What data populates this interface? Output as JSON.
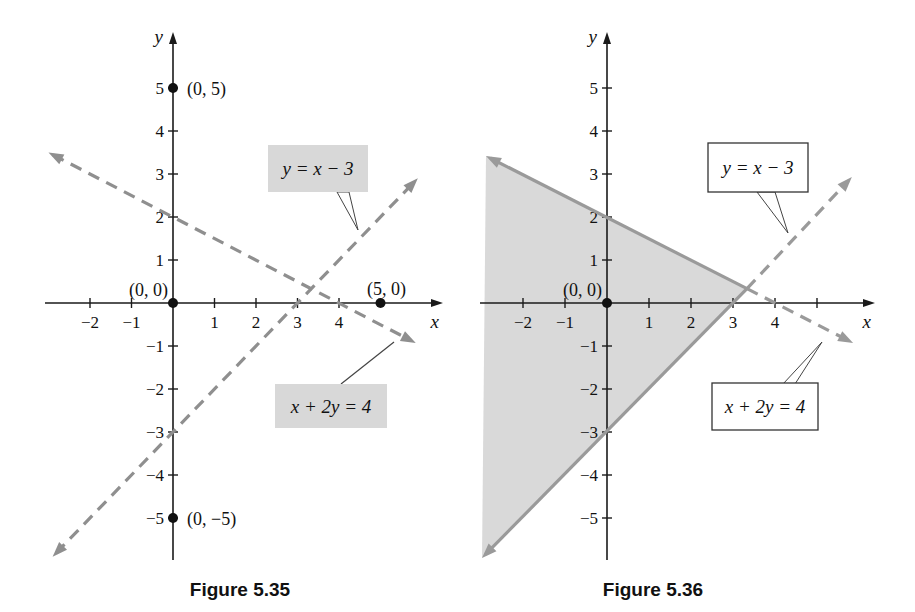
{
  "page": {
    "background": "#ffffff"
  },
  "chart_data": [
    {
      "type": "line",
      "figure_id": "5.35",
      "title": "Figure 5.35",
      "xlabel": "x",
      "ylabel": "y",
      "xlim": [
        -3.1,
        6.5
      ],
      "ylim": [
        -6.0,
        6.3
      ],
      "grid": false,
      "x_ticks": [
        -2,
        -1,
        1,
        2,
        3,
        4
      ],
      "x_ticks_unlabeled": [],
      "y_ticks": [
        5,
        4,
        3,
        2,
        1,
        -1,
        -2,
        -3,
        -4,
        -5
      ],
      "axis_color": "#1a1a1a",
      "series": [
        {
          "name": "y = x − 3",
          "equation": "y = x − 3",
          "color": "#8f8f8f",
          "style": "dashed",
          "x_intercept": 3,
          "y_intercept": -3,
          "segments": [
            {
              "from": [
                -2.9,
                -5.9
              ],
              "to": [
                5.9,
                2.9
              ],
              "style": "dashed",
              "arrows": [
                "from",
                "to"
              ]
            }
          ]
        },
        {
          "name": "x + 2y = 4",
          "equation": "x + 2y = 4",
          "color": "#8f8f8f",
          "style": "dashed",
          "x_intercept": 4,
          "y_intercept": 2,
          "segments": [
            {
              "from": [
                -3.0,
                3.5
              ],
              "to": [
                5.85,
                -0.93
              ],
              "style": "dashed",
              "arrows": [
                "from",
                "to"
              ]
            }
          ]
        }
      ],
      "marked_points": [
        {
          "label": "(0, 5)",
          "x": 0,
          "y": 5,
          "label_pos": "right"
        },
        {
          "label": "(0, 0)",
          "x": 0,
          "y": 0,
          "label_pos": "above-left"
        },
        {
          "label": "(5, 0)",
          "x": 5,
          "y": 0,
          "label_pos": "above"
        },
        {
          "label": "(0, −5)",
          "x": 0,
          "y": -5,
          "label_pos": "right"
        }
      ],
      "annotations": [
        {
          "text": "y = x − 3",
          "box_fill": "#d8d8d8",
          "box_stroke": "none"
        },
        {
          "text": "x + 2y = 4",
          "box_fill": "#d8d8d8",
          "box_stroke": "none"
        }
      ]
    },
    {
      "type": "line",
      "figure_id": "5.36",
      "title": "Figure 5.36",
      "xlabel": "x",
      "ylabel": "y",
      "xlim": [
        -3.05,
        6.4
      ],
      "ylim": [
        -6.0,
        6.3
      ],
      "grid": false,
      "x_ticks": [
        -2,
        -1,
        1,
        2,
        3,
        4
      ],
      "x_ticks_unlabeled": [
        5
      ],
      "y_ticks": [
        5,
        4,
        3,
        2,
        1,
        -1,
        -2,
        -3,
        -4,
        -5
      ],
      "axis_color": "#1a1a1a",
      "region": {
        "vertices": [
          [
            3.333,
            0.333
          ],
          [
            -2.881,
            3.419
          ],
          [
            -2.976,
            -5.93
          ]
        ],
        "fill": "#d9d9d9"
      },
      "series": [
        {
          "name": "y = x − 3",
          "equation": "y = x − 3",
          "color": "#9a9a9a",
          "x_intercept": 3,
          "y_intercept": -3,
          "segments": [
            {
              "from": [
                -2.976,
                -5.93
              ],
              "to": [
                3.333,
                0.333
              ],
              "style": "solid",
              "arrows": [
                "from"
              ]
            },
            {
              "from": [
                3.333,
                0.333
              ],
              "to": [
                5.83,
                2.93
              ],
              "style": "dashed",
              "arrows": [
                "to"
              ]
            }
          ]
        },
        {
          "name": "x + 2y = 4",
          "equation": "x + 2y = 4",
          "color": "#9a9a9a",
          "x_intercept": 4,
          "y_intercept": 2,
          "segments": [
            {
              "from": [
                -2.881,
                3.419
              ],
              "to": [
                3.333,
                0.333
              ],
              "style": "solid",
              "arrows": [
                "from"
              ]
            },
            {
              "from": [
                3.333,
                0.333
              ],
              "to": [
                5.86,
                -0.93
              ],
              "style": "dashed",
              "arrows": [
                "to"
              ]
            }
          ]
        }
      ],
      "marked_points": [
        {
          "label": "(0, 0)",
          "x": 0,
          "y": 0,
          "label_pos": "above-left"
        }
      ],
      "annotations": [
        {
          "text": "y = x − 3",
          "box_fill": "#ffffff",
          "box_stroke": "#333333"
        },
        {
          "text": "x + 2y = 4",
          "box_fill": "#ffffff",
          "box_stroke": "#333333"
        }
      ]
    }
  ]
}
